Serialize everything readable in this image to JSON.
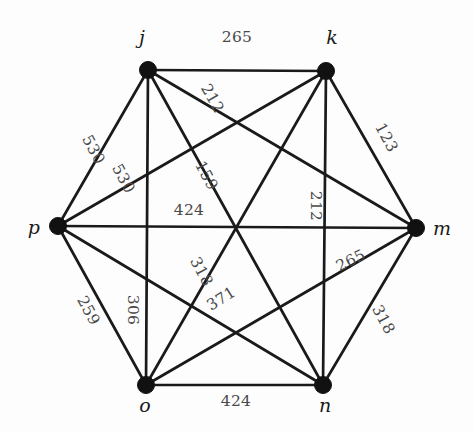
{
  "figure": {
    "type": "weighted-complete-graph",
    "name": "complete-graph-k6",
    "vertex_count": 6,
    "edge_count": 15,
    "background_color": "#fdfdfd",
    "edge_color": "#1a1a1a",
    "vertex_color": "#111111",
    "label_color": "#4a4a4a"
  },
  "vertices": [
    {
      "id": "j",
      "label": "j",
      "x": 148,
      "y": 70,
      "label_x": 142,
      "label_y": 44,
      "label_anchor": "middle"
    },
    {
      "id": "k",
      "label": "k",
      "x": 326,
      "y": 71,
      "label_x": 332,
      "label_y": 44,
      "label_anchor": "middle"
    },
    {
      "id": "m",
      "label": "m",
      "x": 416,
      "y": 228,
      "label_x": 433,
      "label_y": 235,
      "label_anchor": "start"
    },
    {
      "id": "n",
      "label": "n",
      "x": 323,
      "y": 385,
      "label_x": 325,
      "label_y": 412,
      "label_anchor": "middle"
    },
    {
      "id": "o",
      "label": "o",
      "x": 146,
      "y": 385,
      "label_x": 145,
      "label_y": 412,
      "label_anchor": "middle"
    },
    {
      "id": "p",
      "label": "p",
      "x": 58,
      "y": 226,
      "label_x": 40,
      "label_y": 234,
      "label_anchor": "end"
    }
  ],
  "edges": [
    {
      "id": "j-k",
      "from": "j",
      "to": "k",
      "weight": "265",
      "label_x": 237,
      "label_y": 42,
      "rotation": 0
    },
    {
      "id": "j-m",
      "from": "j",
      "to": "m",
      "weight": "212",
      "label_x": 208,
      "label_y": 101,
      "rotation": 60
    },
    {
      "id": "j-p",
      "from": "j",
      "to": "p",
      "weight": "530",
      "label_x": 89,
      "label_y": 152,
      "rotation": 62
    },
    {
      "id": "p-k",
      "from": "p",
      "to": "k",
      "weight": "530",
      "label_x": 119,
      "label_y": 181,
      "rotation": 62
    },
    {
      "id": "j-n",
      "from": "j",
      "to": "n",
      "weight": "159",
      "label_x": 202,
      "label_y": 178,
      "rotation": 62
    },
    {
      "id": "p-m",
      "from": "p",
      "to": "m",
      "weight": "424",
      "label_x": 189,
      "label_y": 215,
      "rotation": 0
    },
    {
      "id": "k-n",
      "from": "k",
      "to": "n",
      "weight": "212",
      "label_x": 311,
      "label_y": 206,
      "rotation": 90
    },
    {
      "id": "k-m",
      "from": "k",
      "to": "m",
      "weight": "123",
      "label_x": 382,
      "label_y": 140,
      "rotation": 62
    },
    {
      "id": "o-m",
      "from": "o",
      "to": "m",
      "weight": "265",
      "label_x": 353,
      "label_y": 265,
      "rotation": -26
    },
    {
      "id": "n-m",
      "from": "n",
      "to": "m",
      "weight": "318",
      "label_x": 379,
      "label_y": 322,
      "rotation": 62
    },
    {
      "id": "p-o",
      "from": "p",
      "to": "o",
      "weight": "259",
      "label_x": 84,
      "label_y": 313,
      "rotation": 62
    },
    {
      "id": "j-o",
      "from": "j",
      "to": "o",
      "weight": "306",
      "label_x": 128,
      "label_y": 310,
      "rotation": 90
    },
    {
      "id": "p-n",
      "from": "p",
      "to": "n",
      "weight": "318",
      "label_x": 197,
      "label_y": 274,
      "rotation": 62
    },
    {
      "id": "o-k",
      "from": "o",
      "to": "k",
      "weight": "371",
      "label_x": 224,
      "label_y": 303,
      "rotation": -32
    },
    {
      "id": "o-n",
      "from": "o",
      "to": "n",
      "weight": "424",
      "label_x": 236,
      "label_y": 406,
      "rotation": 0
    }
  ]
}
